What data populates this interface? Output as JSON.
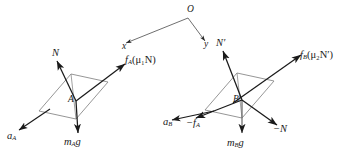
{
  "figure": {
    "type": "physics-free-body-diagram",
    "background_color": "#ffffff",
    "stroke_color": "#1a1a1a",
    "block_outline_color": "#6b6b6b"
  },
  "coordinate_system": {
    "origin_label": "O",
    "x_axis_label": "x",
    "y_axis_label": "y",
    "origin_point": [
      188,
      18
    ],
    "x_axis_end": [
      124,
      44
    ],
    "y_axis_end": [
      206,
      42
    ]
  },
  "blocks": [
    {
      "id": "block-a",
      "center_label": "A",
      "center_point": [
        73,
        97
      ],
      "incline_angle_deg": 24,
      "width": 76,
      "height": 40
    },
    {
      "id": "block-b",
      "center_label": "B",
      "center_point": [
        239,
        96
      ],
      "incline_angle_deg": 24,
      "width": 76,
      "height": 40
    }
  ],
  "vectors": {
    "block_a": [
      {
        "name": "normal-force",
        "label_text": "N",
        "label_sub": "",
        "label_paren": "",
        "from": [
          73,
          97
        ],
        "to": [
          56,
          62
        ],
        "label_pos": [
          54,
          51
        ]
      },
      {
        "name": "friction-force",
        "label_text": "f",
        "label_sub": "A",
        "label_paren": "(μ₁N)",
        "from": [
          73,
          97
        ],
        "to": [
          124,
          63
        ],
        "label_pos": [
          126,
          57
        ]
      },
      {
        "name": "weight-force",
        "label_text": "m",
        "label_sub": "A",
        "label_paren": "g",
        "from": [
          73,
          97
        ],
        "to": [
          76,
          134
        ],
        "label_pos": [
          66,
          138
        ]
      },
      {
        "name": "acceleration",
        "label_text": "a",
        "label_sub": "A",
        "label_paren": "",
        "from": [
          49,
          110
        ],
        "to": [
          17,
          131
        ],
        "label_pos": [
          9,
          132
        ]
      }
    ],
    "block_b": [
      {
        "name": "normal-force-prime",
        "label_text": "N′",
        "label_sub": "",
        "label_paren": "",
        "from": [
          239,
          96
        ],
        "to": [
          222,
          52
        ],
        "label_pos": [
          218,
          40
        ]
      },
      {
        "name": "friction-force-b",
        "label_text": "f",
        "label_sub": "B",
        "label_paren": "(μ₂N′)",
        "from": [
          239,
          96
        ],
        "to": [
          300,
          56
        ],
        "label_pos": [
          300,
          52
        ]
      },
      {
        "name": "weight-force-b",
        "label_text": "m",
        "label_sub": "B",
        "label_paren": "g",
        "from": [
          239,
          96
        ],
        "to": [
          240,
          134
        ],
        "label_pos": [
          229,
          139
        ]
      },
      {
        "name": "reaction-friction",
        "label_text": "−f",
        "label_sub": "A",
        "label_paren": "",
        "from": [
          239,
          96
        ],
        "to": [
          178,
          121
        ],
        "label_pos": [
          187,
          119
        ]
      },
      {
        "name": "reaction-normal",
        "label_text": "−N",
        "label_sub": "",
        "label_paren": "",
        "from": [
          239,
          96
        ],
        "to": [
          278,
          126
        ],
        "label_pos": [
          275,
          126
        ]
      },
      {
        "name": "acceleration-b",
        "label_text": "a",
        "label_sub": "B",
        "label_paren": "",
        "from": [
          213,
          112
        ],
        "to": [
          170,
          120
        ],
        "label_pos": [
          166,
          118
        ]
      }
    ]
  }
}
